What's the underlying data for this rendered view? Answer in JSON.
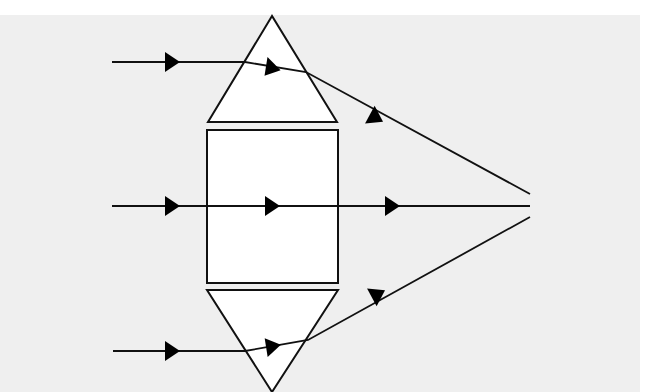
{
  "caption_fragment": "ray optics diagram",
  "diagram": {
    "type": "lens-prism-model",
    "colors": {
      "background": "#efefef",
      "shape_fill": "#ffffff",
      "stroke": "#111111"
    },
    "shapes": {
      "top_prism": {
        "points": "272,16 208,122 337,122"
      },
      "center_block": {
        "x": 207,
        "y": 130,
        "width": 131,
        "height": 153
      },
      "bottom_prism": {
        "points": "207,290 338,290 272,392"
      }
    },
    "rays": [
      {
        "label": "top-ray",
        "path": "112,62 245,62 306,72 530,194"
      },
      {
        "label": "middle-ray",
        "path": "112,206 530,206"
      },
      {
        "label": "bottom-ray",
        "path": "113,351 245,351 308,340 530,217"
      }
    ],
    "focal_point": {
      "x": 511,
      "y": 205
    }
  }
}
